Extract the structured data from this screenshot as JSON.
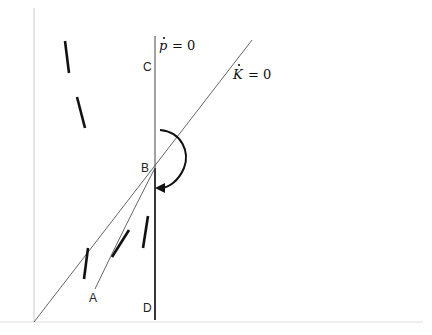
{
  "diagram": {
    "type": "phase-diagram",
    "axes": {
      "origin": [
        34,
        322
      ],
      "vertical_axis_top": [
        34,
        8
      ],
      "horizontal_axis_end": [
        423,
        322
      ],
      "color": "#cccccc"
    },
    "loci": {
      "p_dot_zero": {
        "label_var": "p",
        "label_rest": "= 0",
        "x": 155,
        "y_top": 36,
        "y_bottom": 322,
        "color_upper": "#444444",
        "color_lower": "#222222"
      },
      "k_dot_zero": {
        "label_var": "K",
        "label_rest": "= 0",
        "start": [
          34,
          322
        ],
        "end": [
          252,
          40
        ],
        "color": "#555555"
      }
    },
    "points": {
      "A": {
        "label": "A",
        "x": 89,
        "y": 302
      },
      "B": {
        "label": "B",
        "x": 141,
        "y": 172
      },
      "C": {
        "label": "C",
        "x": 143,
        "y": 71
      },
      "D": {
        "label": "D",
        "x": 143,
        "y": 312
      }
    },
    "saddle_path": {
      "from": "A",
      "to": "B",
      "color": "#555555"
    },
    "rotation_arrow": {
      "direction": "clockwise",
      "color": "#111111"
    },
    "trajectory_segments": [
      {
        "x1": 65,
        "y1": 41,
        "x2": 69,
        "y2": 73
      },
      {
        "x1": 77,
        "y1": 97,
        "x2": 85,
        "y2": 128
      },
      {
        "x1": 88,
        "y1": 248,
        "x2": 84,
        "y2": 279
      },
      {
        "x1": 112,
        "y1": 257,
        "x2": 129,
        "y2": 230
      },
      {
        "x1": 148,
        "y1": 216,
        "x2": 143,
        "y2": 248
      }
    ]
  }
}
